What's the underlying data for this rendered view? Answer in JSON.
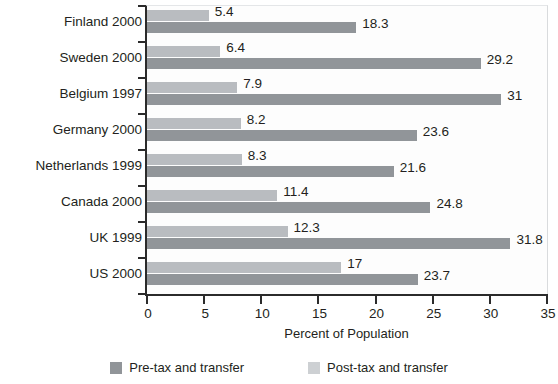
{
  "chart_data": {
    "type": "bar",
    "orientation": "horizontal",
    "title": "",
    "xlabel": "Percent of Population",
    "ylabel": "",
    "xlim": [
      0,
      35
    ],
    "xticks": [
      "0",
      "5",
      "10",
      "15",
      "20",
      "25",
      "30",
      "35"
    ],
    "grid": false,
    "legend_position": "bottom",
    "categories": [
      "Finland 2000",
      "Sweden 2000",
      "Belgium 1997",
      "Germany 2000",
      "Netherlands 1999",
      "Canada 2000",
      "UK 1999",
      "US 2000"
    ],
    "series": [
      {
        "name": "Post-tax and transfer",
        "color": "#b9bcc0",
        "values": [
          5.4,
          6.4,
          7.9,
          8.2,
          8.3,
          11.4,
          12.3,
          17
        ],
        "labels": [
          "5.4",
          "6.4",
          "7.9",
          "8.2",
          "8.3",
          "11.4",
          "12.3",
          "17"
        ]
      },
      {
        "name": "Pre-tax and transfer",
        "color": "#919599",
        "values": [
          18.3,
          29.2,
          31,
          23.6,
          21.6,
          24.8,
          31.8,
          23.7
        ],
        "labels": [
          "18.3",
          "29.2",
          "31",
          "23.6",
          "21.6",
          "24.8",
          "31.8",
          "23.7"
        ]
      }
    ]
  },
  "legend": {
    "items": [
      {
        "label": "Pre-tax and transfer",
        "color": "#919599"
      },
      {
        "label": "Post-tax and transfer",
        "color": "#cdd0d3"
      }
    ]
  }
}
